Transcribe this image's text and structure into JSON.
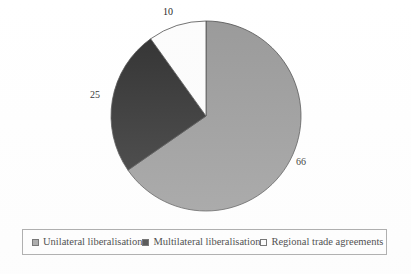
{
  "chart_data": {
    "type": "pie",
    "title": "",
    "subtitle": "",
    "xlabel": "",
    "ylabel": "",
    "categories": [
      "Unilateral liberalisation",
      "Multilateral liberalisation",
      "Regional trade agreements"
    ],
    "values": [
      66,
      25,
      10
    ],
    "value_labels": [
      "66",
      "25",
      "10"
    ],
    "colors": [
      "#999999",
      "#2f2f2f",
      "#fcfcfc"
    ],
    "slice_border_color": "#4d4d4d",
    "start_angle_deg": 0,
    "direction": "clockwise",
    "legend_position": "bottom",
    "grid": false,
    "slices": [
      {
        "label": "Unilateral liberalisation",
        "value": 66,
        "value_label": "66",
        "color": "#999999",
        "sweep_deg": 237.6
      },
      {
        "label": "Multilateral liberalisation",
        "value": 25,
        "value_label": "25",
        "color": "#2f2f2f",
        "sweep_deg": 90.0
      },
      {
        "label": "Regional trade agreements",
        "value": 10,
        "value_label": "10",
        "color": "#fcfcfc",
        "sweep_deg": 36.0
      }
    ]
  },
  "labels": {
    "unilateral": "66",
    "multilateral": "25",
    "regional": "10"
  },
  "legend": {
    "items": [
      {
        "label": "Unilateral liberalisation",
        "color": "#999999"
      },
      {
        "label": "Multilateral liberalisation",
        "color": "#2f2f2f"
      },
      {
        "label": "Regional trade agreements",
        "color": "#fcfcfc"
      }
    ],
    "border_color": "#9c9c9c"
  },
  "figure": {
    "background": "#ffffff",
    "pie_center_x": 206,
    "pie_center_y": 116,
    "pie_radius": 95
  }
}
